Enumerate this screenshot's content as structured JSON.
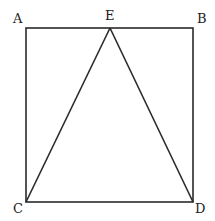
{
  "diagram": {
    "type": "geometry",
    "colors": {
      "stroke": "#2a2a2a",
      "label": "#222222",
      "background": "#ffffff"
    },
    "points": {
      "A": {
        "label": "A",
        "x": 26,
        "y": 28,
        "lx": 13,
        "ly": 23
      },
      "B": {
        "label": "B",
        "x": 193,
        "y": 28,
        "lx": 197,
        "ly": 23
      },
      "C": {
        "label": "C",
        "x": 26,
        "y": 202,
        "lx": 13,
        "ly": 213
      },
      "D": {
        "label": "D",
        "x": 193,
        "y": 202,
        "lx": 195,
        "ly": 213
      },
      "E": {
        "label": "E",
        "x": 110,
        "y": 28,
        "lx": 105,
        "ly": 20
      }
    },
    "segments": [
      {
        "name": "AB",
        "from": "A",
        "to": "B"
      },
      {
        "name": "BD",
        "from": "B",
        "to": "D"
      },
      {
        "name": "DC",
        "from": "D",
        "to": "C"
      },
      {
        "name": "CA",
        "from": "C",
        "to": "A"
      },
      {
        "name": "EC",
        "from": "E",
        "to": "C"
      },
      {
        "name": "ED",
        "from": "E",
        "to": "D"
      }
    ]
  }
}
